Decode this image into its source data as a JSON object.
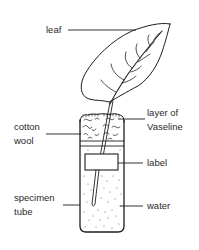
{
  "diagram": {
    "labels": {
      "leaf": "leaf",
      "vaseline_line1": "layer of",
      "vaseline_line2": "Vaseline",
      "cotton_line1": "cotton",
      "cotton_line2": "wool",
      "label": "label",
      "specimen_line1": "specimen",
      "specimen_line2": "tube",
      "water": "water"
    },
    "colors": {
      "ink": "#1e1e1e",
      "text": "#2a2a2a",
      "background": "#ffffff"
    }
  }
}
